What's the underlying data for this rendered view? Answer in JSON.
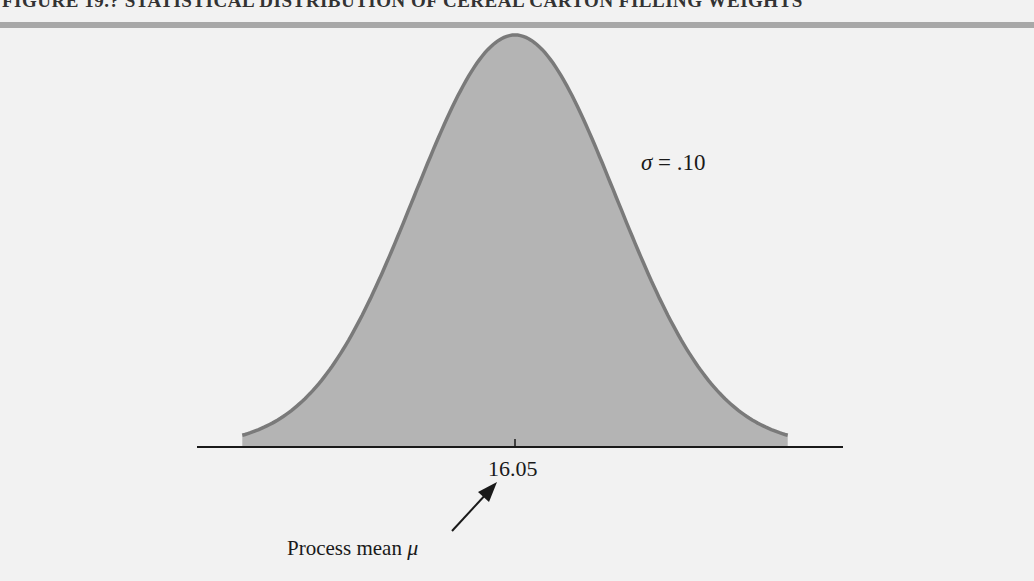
{
  "figure": {
    "title": "FIGURE 19.? STATISTICAL DISTRIBUTION OF CEREAL CARTON FILLING WEIGHTS",
    "title_cropped": true
  },
  "annotations": {
    "sigma_symbol": "σ",
    "sigma_text": " = .10",
    "mean_value": "16.05",
    "mean_caption": "Process mean ",
    "mean_symbol": "μ"
  },
  "colors": {
    "background": "#f2f2f2",
    "top_rule": "#a8a8a8",
    "fill": "#b4b4b4",
    "outline": "#7a7a7a",
    "axis": "#1a1a1a"
  },
  "chart_data": {
    "type": "area",
    "distribution": "normal",
    "mean": 16.05,
    "std_dev": 0.1,
    "x_tick_labels": [
      "16.05"
    ],
    "x": [
      15.78,
      15.85,
      15.9,
      15.95,
      16.0,
      16.05,
      16.1,
      16.15,
      16.2,
      16.25,
      16.32
    ],
    "values": [
      0.106,
      0.54,
      1.295,
      2.42,
      3.521,
      3.989,
      3.521,
      2.42,
      1.295,
      0.54,
      0.106
    ],
    "annotations": [
      "σ = .10",
      "Process mean μ (arrow to 16.05)"
    ],
    "xlabel": "",
    "ylabel": "",
    "grid": false,
    "legend": "none"
  }
}
